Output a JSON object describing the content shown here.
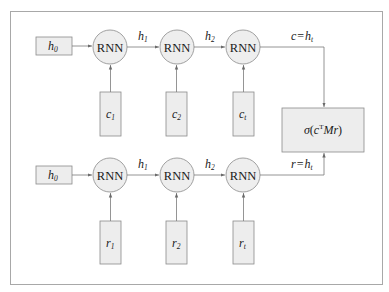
{
  "diagram": {
    "type": "siamese-rnn-dual-encoder",
    "top_row": {
      "initial_state": {
        "var": "h",
        "sub": "0"
      },
      "nodes": [
        "RNN",
        "RNN",
        "RNN"
      ],
      "hidden_labels": [
        {
          "var": "h",
          "sub": "1"
        },
        {
          "var": "h",
          "sub": "2"
        }
      ],
      "inputs": [
        {
          "var": "c",
          "sub": "1"
        },
        {
          "var": "c",
          "sub": "2"
        },
        {
          "var": "c",
          "sub": "t"
        }
      ],
      "output_label": {
        "lhs": "c",
        "eq": "=",
        "var": "h",
        "sub": "t"
      }
    },
    "bottom_row": {
      "initial_state": {
        "var": "h",
        "sub": "0"
      },
      "nodes": [
        "RNN",
        "RNN",
        "RNN"
      ],
      "hidden_labels": [
        {
          "var": "h",
          "sub": "1"
        },
        {
          "var": "h",
          "sub": "2"
        }
      ],
      "inputs": [
        {
          "var": "r",
          "sub": "1"
        },
        {
          "var": "r",
          "sub": "2"
        },
        {
          "var": "r",
          "sub": "t"
        }
      ],
      "output_label": {
        "lhs": "r",
        "eq": "=",
        "var": "h",
        "sub": "t"
      }
    },
    "scoring_box": {
      "sigma": "σ",
      "open": "(",
      "c": "c",
      "sup": "T",
      "rest": "Mr",
      "close": ")"
    }
  }
}
